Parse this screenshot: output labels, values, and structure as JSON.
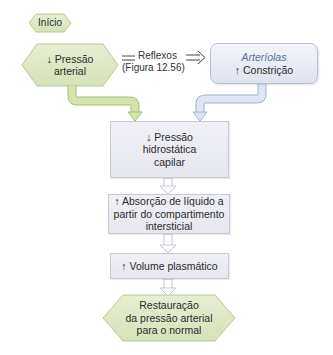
{
  "diagram": {
    "start": {
      "label": "Início"
    },
    "trigger": {
      "line1": "↓ Pressão",
      "line2": "arterial"
    },
    "reflex": {
      "label": "Reflexos",
      "ref": "(Figura 12.56)",
      "connector_icon": "equals-icon",
      "arrow_icon": "double-arrow-right-icon"
    },
    "arterioles": {
      "title": "Arteríolas",
      "effect": "↑ Constrição"
    },
    "steps": [
      {
        "lines": [
          "↓ Pressão",
          "hidrostática",
          "capilar"
        ]
      },
      {
        "lines": [
          "↑ Absorção de líquido a",
          "partir do compartimento",
          "intersticial"
        ]
      },
      {
        "lines": [
          "↑ Volume plasmático"
        ]
      }
    ],
    "end": {
      "lines": [
        "Restauração",
        "da pressão arterial",
        "para o normal"
      ]
    }
  },
  "colors": {
    "green_fill": "#dfe8c8",
    "green_stroke": "#b9c98e",
    "green_arrow": "#cfe0a4",
    "blue_arrow": "#c8d2e6",
    "box_fill": "#ececf3",
    "arterioles_title": "#5a6e9a"
  }
}
